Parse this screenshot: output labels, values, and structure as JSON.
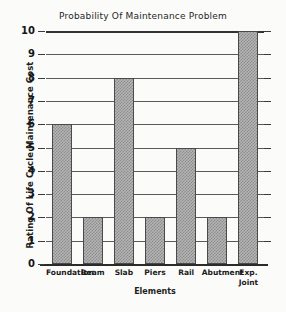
{
  "chart_data": {
    "type": "bar",
    "title": "Probability Of Maintenance Problem",
    "xlabel": "Elements",
    "ylabel": "Rating Of Life Cycle Maintenance Cost",
    "categories": [
      "Foundation",
      "Beam",
      "Slab",
      "Piers",
      "Rail",
      "Abutment",
      "Exp. Joint"
    ],
    "category_display": [
      "Foundation",
      "Beam",
      "Slab",
      "Piers",
      "Rail",
      "Abutment",
      "Exp.\nJoint"
    ],
    "values": [
      6,
      2,
      8,
      2,
      5,
      2,
      10
    ],
    "ylim": [
      0,
      10
    ],
    "yticks": [
      0,
      1,
      2,
      3,
      4,
      5,
      6,
      7,
      8,
      9,
      10
    ],
    "ytick_labels": [
      "0",
      "1",
      "2",
      "3",
      "4",
      "5",
      "6",
      "7",
      "8",
      "9",
      "10"
    ],
    "grid": true,
    "grid_axis": "y",
    "legend": false,
    "bar_fill": "#b4b4b4",
    "bar_pattern": "checkerboard-dither",
    "bar_edge_color": "#4a4a4a",
    "axis_color": "#333333",
    "background": "#fbfbfa"
  }
}
